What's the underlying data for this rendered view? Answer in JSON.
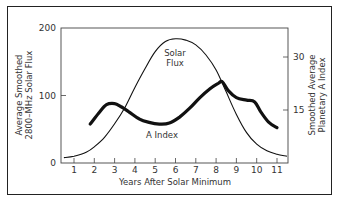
{
  "chart_data": {
    "type": "line",
    "title": "",
    "xlabel": "Years After Solar Minimum",
    "ylabel": "Average Smoothed 2800–MHz Solar Flux",
    "ylabel_lines": [
      "Average Smoothed",
      "2800–MHz Solar Flux"
    ],
    "y2label": "Smoothed Average Planetary A Index",
    "y2label_lines": [
      "Smoothed Average",
      "Planetary A Index"
    ],
    "xlim": [
      0.4,
      11.5
    ],
    "ylim": [
      0,
      200
    ],
    "y2lim": [
      0,
      38
    ],
    "x_ticks": [
      "1",
      "2",
      "3",
      "4",
      "5",
      "6",
      "7",
      "8",
      "9",
      "10",
      "11"
    ],
    "y_ticks": [
      "0",
      "100",
      "200"
    ],
    "y2_ticks": [
      "15",
      "30"
    ],
    "grid": false,
    "legend": "none (inline labels)",
    "series": [
      {
        "name": "Solar Flux",
        "axis": "left",
        "label": [
          "Solar",
          "Flux"
        ],
        "x": [
          0.5,
          1.0,
          1.6,
          2.0,
          2.5,
          3.0,
          3.5,
          4.0,
          4.5,
          5.0,
          5.5,
          6.0,
          6.5,
          7.0,
          7.5,
          8.0,
          8.5,
          9.0,
          9.5,
          10.0,
          10.5,
          11.0,
          11.5
        ],
        "values": [
          8,
          10,
          16,
          24,
          38,
          58,
          82,
          112,
          140,
          165,
          180,
          184,
          182,
          175,
          160,
          138,
          105,
          72,
          45,
          28,
          18,
          13,
          10
        ]
      },
      {
        "name": "A Index",
        "axis": "right",
        "label": [
          "A Index"
        ],
        "x": [
          1.8,
          2.2,
          2.6,
          3.0,
          3.3,
          3.7,
          4.2,
          4.7,
          5.2,
          5.7,
          6.2,
          6.7,
          7.2,
          7.7,
          8.1,
          8.3,
          8.6,
          9.0,
          9.5,
          9.9,
          10.2,
          10.6,
          11.0
        ],
        "values": [
          11,
          14,
          16.5,
          16.8,
          16,
          14.5,
          12.5,
          11.5,
          11,
          11.3,
          13,
          15.5,
          18.5,
          21,
          22.5,
          23,
          20.5,
          18.5,
          17.8,
          17.3,
          14.5,
          11.5,
          10
        ]
      }
    ]
  }
}
